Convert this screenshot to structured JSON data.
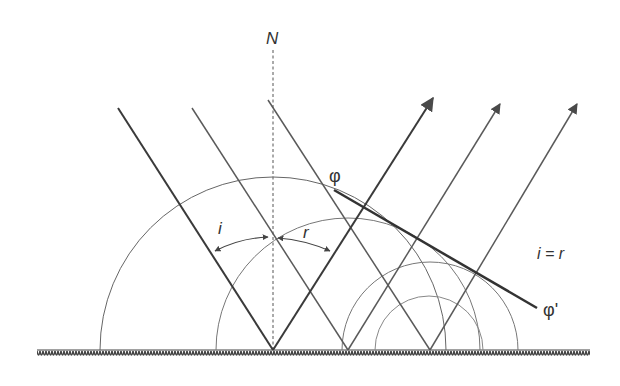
{
  "diagram": {
    "labels": {
      "normal": "N",
      "incidence_angle": "i",
      "reflection_angle": "r",
      "wavefront_start": "φ",
      "wavefront_end": "φ'",
      "law": "i = r"
    },
    "colors": {
      "stroke_dark": "#3a3a3a",
      "stroke_mid": "#5a5a5a",
      "stroke_light": "#777777",
      "background": "#ffffff"
    }
  }
}
